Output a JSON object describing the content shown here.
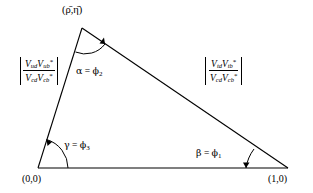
{
  "figure": {
    "name": "ckm-unitarity-triangle",
    "background_color": "#ffffff",
    "line_color": "#000000"
  },
  "vertices": {
    "apex": {
      "label": "(ρ̄,η̄)",
      "x": 82,
      "y": 28
    },
    "origin": {
      "label": "(0,0)",
      "x": 38,
      "y": 168
    },
    "unit": {
      "label": "(1,0)",
      "x": 288,
      "y": 168
    }
  },
  "angles": [
    {
      "id": "alpha",
      "symbol": "α",
      "equals": "=",
      "phi": "ϕ",
      "index": "2",
      "text": "α = ϕ₂",
      "at": "apex"
    },
    {
      "id": "beta",
      "symbol": "β",
      "equals": "=",
      "phi": "ϕ",
      "index": "1",
      "text": "β = ϕ₁",
      "at": "unit"
    },
    {
      "id": "gamma",
      "symbol": "γ",
      "equals": "=",
      "phi": "ϕ",
      "index": "3",
      "text": "γ = ϕ₃",
      "at": "origin"
    }
  ],
  "sides": {
    "left": {
      "numerator": {
        "v1": "V",
        "v1sub": "ud",
        "v2": "V",
        "v2sub": "ub",
        "v2sup": "*"
      },
      "denominator": {
        "v1": "V",
        "v1sub": "cd",
        "v2": "V",
        "v2sub": "cb",
        "v2sup": "*"
      }
    },
    "right": {
      "numerator": {
        "v1": "V",
        "v1sub": "td",
        "v2": "V",
        "v2sub": "tb",
        "v2sup": "*"
      },
      "denominator": {
        "v1": "V",
        "v1sub": "cd",
        "v2": "V",
        "v2sub": "cb",
        "v2sup": "*"
      }
    }
  }
}
